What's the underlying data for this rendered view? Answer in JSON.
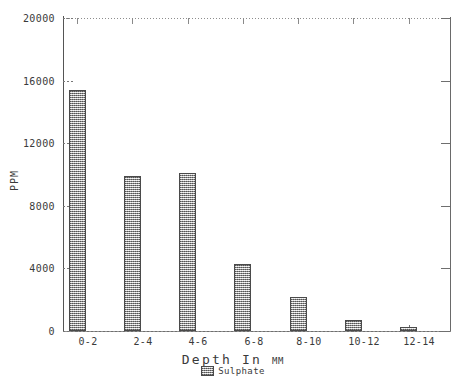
{
  "chart_data": {
    "type": "bar",
    "title": "",
    "xlabel": "Depth In MM",
    "xlabel_main": "Depth In",
    "xlabel_unit": "MM",
    "ylabel": "PPM",
    "categories": [
      "0-2",
      "2-4",
      "4-6",
      "6-8",
      "8-10",
      "10-12",
      "12-14"
    ],
    "values": [
      15400,
      9900,
      10100,
      4300,
      2200,
      700,
      250
    ],
    "series": [
      {
        "name": "Sulphate",
        "values": [
          15400,
          9900,
          10100,
          4300,
          2200,
          700,
          250
        ]
      }
    ],
    "ylim": [
      0,
      20000
    ],
    "yticks": [
      0,
      4000,
      8000,
      12000,
      16000,
      20000
    ],
    "ytick_labels": [
      "0",
      "4000",
      "8000",
      "12000",
      "16000",
      "20000"
    ],
    "grid": false,
    "legend": {
      "position": "bottom-center",
      "entries": [
        {
          "label": "Sulphate",
          "swatch": "hatched-gray-checker"
        }
      ]
    },
    "colors": {
      "bar_fill": "#a8a8a8",
      "bar_edge": "#4a4a4a",
      "axis": "#555555",
      "text": "#3a3a3a",
      "background": "#ffffff"
    }
  }
}
